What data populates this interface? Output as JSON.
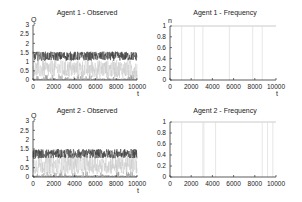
{
  "chart_data": [
    {
      "id": "agent1-observed",
      "type": "line",
      "title": "Agent 1 - Observed",
      "xlabel": "t",
      "ylabel": "Q",
      "xlim": [
        0,
        10000
      ],
      "ylim": [
        0,
        3
      ],
      "xticks": [
        "0",
        "2000",
        "4000",
        "6000",
        "8000",
        "10000"
      ],
      "yticks": [
        "0",
        "0.5",
        "1",
        "1.5",
        "2",
        "2.5",
        "3"
      ],
      "grid": false,
      "series": [
        {
          "name": "dark (high Q)",
          "color": "#3a3a3a",
          "mean": 1.3,
          "spread": 0.25
        },
        {
          "name": "light (mid Q)",
          "color": "#c8c8c8",
          "mean": 0.55,
          "spread": 0.35
        },
        {
          "name": "medium (low Q)",
          "color": "#8a8a8a",
          "mean": 0.05,
          "spread": 0.08
        }
      ],
      "frame": {
        "x0": 33,
        "x1": 137,
        "y0": 80,
        "y1": 25,
        "title_y": 15
      }
    },
    {
      "id": "agent1-frequency",
      "type": "line",
      "title": "Agent 1 - Frequency",
      "xlabel": "t",
      "ylabel": "n",
      "xlim": [
        0,
        10000
      ],
      "ylim": [
        0,
        1
      ],
      "xticks": [
        "0",
        "2000",
        "4000",
        "6000",
        "8000",
        "10000"
      ],
      "yticks": [
        "0",
        "0.2",
        "0.4",
        "0.6",
        "0.8",
        "1"
      ],
      "grid": false,
      "series": [
        {
          "name": "n",
          "color": "#bdbdbd",
          "base": 1,
          "drops_at": [
            1100,
            2300,
            3100,
            5600,
            7800,
            8700
          ]
        }
      ],
      "frame": {
        "x0": 170,
        "x1": 276,
        "y0": 80,
        "y1": 26,
        "title_y": 15
      }
    },
    {
      "id": "agent2-observed",
      "type": "line",
      "title": "Agent 2 - Observed",
      "xlabel": "t",
      "ylabel": "Q",
      "xlim": [
        0,
        10000
      ],
      "ylim": [
        0,
        3
      ],
      "xticks": [
        "0",
        "2000",
        "4000",
        "6000",
        "8000",
        "10000"
      ],
      "yticks": [
        "0",
        "0.5",
        "1",
        "1.5",
        "2",
        "2.5",
        "3"
      ],
      "grid": false,
      "series": [
        {
          "name": "dark (high Q)",
          "color": "#3a3a3a",
          "mean": 1.25,
          "spread": 0.25
        },
        {
          "name": "light (mid Q)",
          "color": "#c8c8c8",
          "mean": 0.6,
          "spread": 0.35
        },
        {
          "name": "medium (low Q)",
          "color": "#8a8a8a",
          "mean": 0.08,
          "spread": 0.08
        }
      ],
      "frame": {
        "x0": 33,
        "x1": 137,
        "y0": 177,
        "y1": 121,
        "title_y": 113
      }
    },
    {
      "id": "agent2-frequency",
      "type": "line",
      "title": "Agent 2 - Frequency",
      "xlabel": "",
      "ylabel": "",
      "xlim": [
        0,
        10000
      ],
      "ylim": [
        0,
        1
      ],
      "xticks": [
        "0",
        "2000",
        "4000",
        "6000",
        "8000",
        "10000"
      ],
      "yticks": [
        "0",
        "0.2",
        "0.4",
        "0.6",
        "0.8",
        "1"
      ],
      "grid": false,
      "series": [
        {
          "name": "n",
          "color": "#bdbdbd",
          "base": 1,
          "drops_at": [
            1100,
            3100,
            3200,
            4300,
            8700,
            9200,
            9700
          ]
        }
      ],
      "frame": {
        "x0": 170,
        "x1": 276,
        "y0": 177,
        "y1": 122,
        "title_y": 113
      }
    }
  ]
}
